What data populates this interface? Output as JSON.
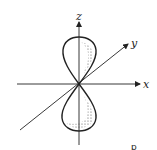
{
  "diagram": {
    "axes": {
      "x_label": "x",
      "y_label": "y",
      "z_label": "z"
    },
    "caption": "p",
    "colors": {
      "line": "#222222",
      "stipple": "#555555",
      "background": "#ffffff"
    }
  }
}
